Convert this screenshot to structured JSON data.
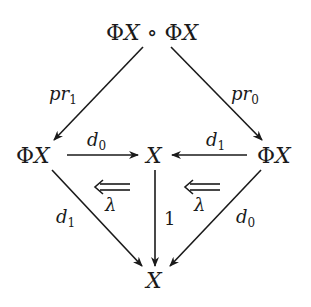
{
  "diagram": {
    "nodes": {
      "top": {
        "phi": "Φ",
        "x": "X",
        "op": " ∘ ",
        "phi2": "Φ",
        "x2": "X"
      },
      "left": {
        "phi": "Φ",
        "x": "X"
      },
      "center": {
        "x": "X"
      },
      "right": {
        "phi": "Φ",
        "x": "X"
      },
      "bottom": {
        "x": "X"
      }
    },
    "edges": {
      "top_left": {
        "base": "pr",
        "sub": "1"
      },
      "top_right": {
        "base": "pr",
        "sub": "0"
      },
      "left_center": {
        "base": "d",
        "sub": "0"
      },
      "right_center": {
        "base": "d",
        "sub": "1"
      },
      "left_bottom": {
        "base": "d",
        "sub": "1"
      },
      "right_bottom": {
        "base": "d",
        "sub": "0"
      },
      "center_bottom": {
        "label": "1"
      }
    },
    "two_cells": {
      "left": {
        "label": "λ"
      },
      "right": {
        "label": "λ"
      }
    },
    "stroke_color": "#1a1a1a"
  }
}
